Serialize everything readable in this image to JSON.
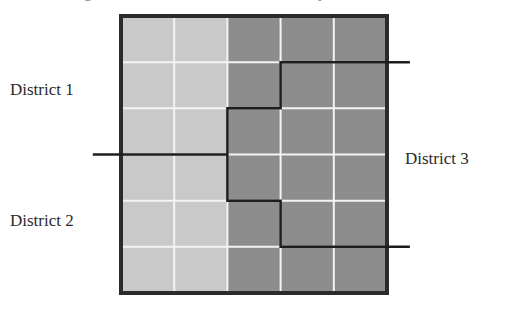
{
  "diagram": {
    "title_fragment_left": "g",
    "title_fragment_right": "y",
    "grid": {
      "columns": 5,
      "rows": 6,
      "cell_shading": [
        [
          "light",
          "light",
          "dark",
          "dark",
          "dark"
        ],
        [
          "light",
          "light",
          "dark",
          "dark",
          "dark"
        ],
        [
          "light",
          "light",
          "dark",
          "dark",
          "dark"
        ],
        [
          "light",
          "light",
          "dark",
          "dark",
          "dark"
        ],
        [
          "light",
          "light",
          "dark",
          "dark",
          "dark"
        ],
        [
          "light",
          "light",
          "dark",
          "dark",
          "dark"
        ]
      ]
    },
    "colors": {
      "light": "#c9c9c9",
      "dark": "#8d8d8d",
      "gridline": "#f4f4f4",
      "border": "#2b2b2b",
      "boundary": "#1e1e1e",
      "text": "#2a2a2a"
    },
    "boundaries": [
      {
        "name": "district-1-2-boundary",
        "points_grid": [
          [
            -0.53,
            3
          ],
          [
            2,
            3
          ]
        ]
      },
      {
        "name": "district-3-boundary",
        "points_grid": [
          [
            5.43,
            1
          ],
          [
            3,
            1
          ],
          [
            3,
            2
          ],
          [
            2,
            2
          ],
          [
            2,
            4
          ],
          [
            3,
            4
          ],
          [
            3,
            5
          ],
          [
            5.43,
            5
          ]
        ]
      }
    ],
    "labels": [
      {
        "id": "district-1",
        "text": "District 1"
      },
      {
        "id": "district-2",
        "text": "District 2"
      },
      {
        "id": "district-3",
        "text": "District 3"
      }
    ]
  }
}
